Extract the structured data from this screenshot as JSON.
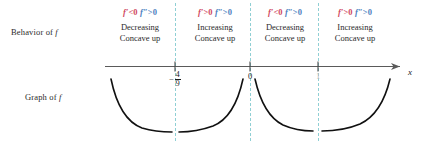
{
  "figure": {
    "row_labels": {
      "behavior": {
        "text": "Behavior of ",
        "var": "f"
      },
      "graph": {
        "text": "Graph of ",
        "var": "f"
      }
    },
    "axis": {
      "variable": "x",
      "ticks": [
        {
          "label": "-4/9",
          "numerator": "4",
          "denominator": "9",
          "minus": "−",
          "is_fraction": true
        },
        {
          "label": "0",
          "is_fraction": false
        },
        {
          "label": "1",
          "is_fraction": false
        }
      ]
    },
    "regions": [
      {
        "id": "region-1",
        "first_derivative": {
          "symbol": "f′",
          "op": "<",
          "value": "0"
        },
        "second_derivative": {
          "symbol": "f″",
          "op": ">",
          "value": "0"
        },
        "monotonicity": "Decreasing",
        "concavity": "Concave up"
      },
      {
        "id": "region-2",
        "first_derivative": {
          "symbol": "f′",
          "op": ">",
          "value": "0"
        },
        "second_derivative": {
          "symbol": "f″",
          "op": ">",
          "value": "0"
        },
        "monotonicity": "Increasing",
        "concavity": "Concave up"
      },
      {
        "id": "region-3",
        "first_derivative": {
          "symbol": "f′",
          "op": "<",
          "value": "0"
        },
        "second_derivative": {
          "symbol": "f″",
          "op": ">",
          "value": "0"
        },
        "monotonicity": "Decreasing",
        "concavity": "Concave up"
      },
      {
        "id": "region-4",
        "first_derivative": {
          "symbol": "f′",
          "op": ">",
          "value": "0"
        },
        "second_derivative": {
          "symbol": "f″",
          "op": ">",
          "value": "0"
        },
        "monotonicity": "Increasing",
        "concavity": "Concave up"
      }
    ],
    "colors": {
      "first_derivative": "#d0475e",
      "second_derivative": "#4c80c0",
      "divider": "#8fcfd4",
      "axis": "#5a5a5a",
      "curve": "#111111",
      "text": "#2a2a2a"
    }
  }
}
